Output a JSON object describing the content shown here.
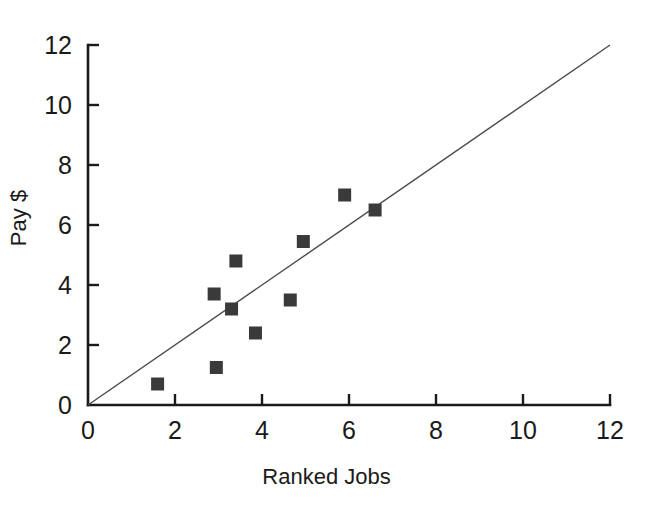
{
  "chart_data": {
    "type": "scatter",
    "title": "",
    "xlabel": "Ranked Jobs",
    "ylabel": "Pay $",
    "xlim": [
      0,
      12
    ],
    "ylim": [
      0,
      12
    ],
    "xticks": [
      0,
      2,
      4,
      6,
      8,
      10,
      12
    ],
    "yticks": [
      0,
      2,
      4,
      6,
      8,
      10,
      12
    ],
    "xtick_labels": [
      "0",
      "2",
      "4",
      "6",
      "8",
      "10",
      "12"
    ],
    "ytick_labels": [
      "0",
      "2",
      "4",
      "6",
      "8",
      "10",
      "12"
    ],
    "grid": false,
    "legend": null,
    "marker": "square",
    "marker_color": "#3a3a3a",
    "marker_size": 13,
    "points": [
      {
        "x": 1.6,
        "y": 0.7
      },
      {
        "x": 2.9,
        "y": 3.7
      },
      {
        "x": 2.95,
        "y": 1.25
      },
      {
        "x": 3.3,
        "y": 3.2
      },
      {
        "x": 3.4,
        "y": 4.8
      },
      {
        "x": 3.85,
        "y": 2.4
      },
      {
        "x": 4.65,
        "y": 3.5
      },
      {
        "x": 4.95,
        "y": 5.45
      },
      {
        "x": 5.9,
        "y": 7.0
      },
      {
        "x": 6.6,
        "y": 6.5
      }
    ],
    "reference_line": {
      "name": "identity-line",
      "x": [
        0,
        12
      ],
      "y": [
        0,
        12
      ],
      "color": "#4a4a4a",
      "width": 1.4
    },
    "axis_color": "#1a1a1a",
    "background": "#ffffff"
  }
}
